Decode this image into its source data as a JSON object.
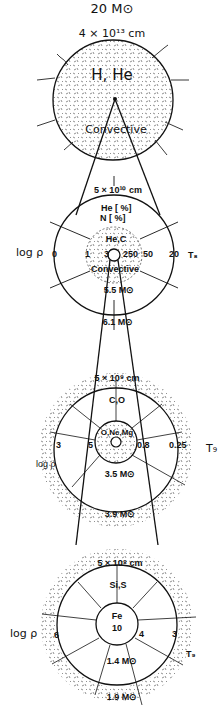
{
  "title": "20 M⊙",
  "stages": [
    {
      "name": "hydrogen-envelope",
      "radius": "4 × 10¹³ cm",
      "composition": "H, He",
      "note": "Convective"
    },
    {
      "name": "helium-burning",
      "radius": "5 × 10¹⁰ cm",
      "shell_lines": [
        "He [     %]",
        "N [     %]"
      ],
      "core_composition": "He,C",
      "core_note": "Convective",
      "left_axis": "log ρ",
      "right_axis": "T₈",
      "scale_values": [
        "0",
        "1",
        "3",
        "250",
        "50",
        "20"
      ],
      "core_mass": "5.5 M⊙",
      "shell_mass": "6.1 M⊙"
    },
    {
      "name": "carbon-burning",
      "radius": "5 × 10⁹ cm",
      "shell_composition": "C,O",
      "core_composition": "O,Ne,Mg",
      "left_axis": "log ρ",
      "right_axis": "T₉",
      "scale_values": [
        "3",
        "5",
        "0.8",
        "0.25"
      ],
      "core_mass": "3.5 M⊙",
      "shell_mass": "3.9 M⊙",
      "neutrino_label": "ν",
      "antineutrino_label": "ν̄"
    },
    {
      "name": "silicon-burning",
      "radius": "5 × 10⁸ cm",
      "shell_composition": "Si,S",
      "core_composition": "Fe",
      "core_value": "10",
      "left_axis": "log ρ",
      "right_axis": "T₉",
      "scale_values": [
        "6",
        "4",
        "3"
      ],
      "core_mass": "1.4 M⊙",
      "shell_mass": "1.9 M⊙",
      "neutrino_label": "ν",
      "antineutrino_label": "ν̄"
    }
  ]
}
